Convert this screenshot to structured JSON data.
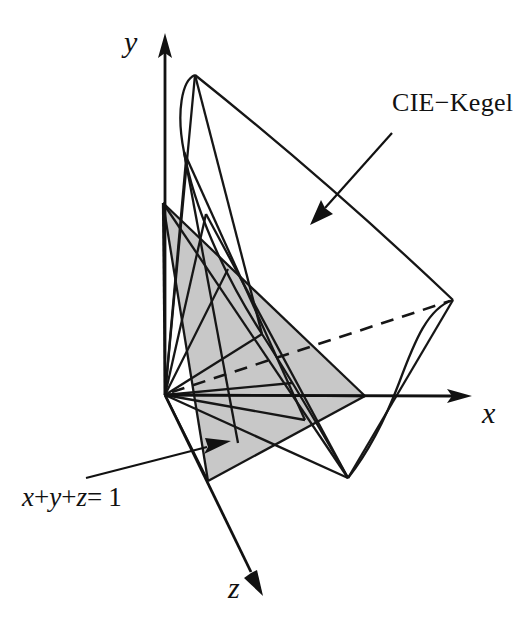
{
  "figure": {
    "background_color": "#ffffff",
    "line_color": "#161616",
    "plane_fill_color": "#c8c8c8",
    "width": 530,
    "height": 633
  },
  "axes": {
    "y": {
      "label": "y",
      "origin": [
        165,
        395
      ],
      "tip": [
        165,
        38
      ],
      "direction": "up"
    },
    "x": {
      "label": "x",
      "origin": [
        165,
        395
      ],
      "tip": [
        467,
        396
      ],
      "direction": "right"
    },
    "z": {
      "label": "z",
      "origin": [
        165,
        395
      ],
      "tip": [
        262,
        592
      ],
      "direction": "down-right"
    }
  },
  "annotations": [
    {
      "id": "cie-kegel",
      "text": "CIE−Kegel",
      "leader_from": [
        391,
        134
      ],
      "leader_to": [
        312,
        223
      ],
      "arrow": true
    },
    {
      "id": "plane-equation",
      "text_parts": [
        "x",
        "+",
        "y",
        "+",
        "z",
        "=",
        "1"
      ],
      "text": "x+y+z= 1",
      "leader_from": [
        86,
        478
      ],
      "leader_to": [
        228,
        447
      ],
      "arrow": true
    }
  ],
  "geometry": {
    "apex": [
      165,
      395
    ],
    "cone_outline_vertices": {
      "top": [
        195,
        75
      ],
      "right": [
        453,
        300
      ],
      "bottom": [
        348,
        478
      ],
      "left_upper": [
        163,
        203
      ],
      "left_lower": [
        208,
        481
      ]
    },
    "plane_triangle_vertices": [
      [
        163,
        203
      ],
      [
        365,
        396
      ],
      [
        208,
        481
      ]
    ],
    "dashed_edge": [
      [
        165,
        395
      ],
      [
        453,
        300
      ]
    ]
  },
  "labels": {
    "y_axis": "y",
    "x_axis": "x",
    "z_axis": "z",
    "cone": "CIE−Kegel",
    "plane": "x+y+z= 1"
  }
}
